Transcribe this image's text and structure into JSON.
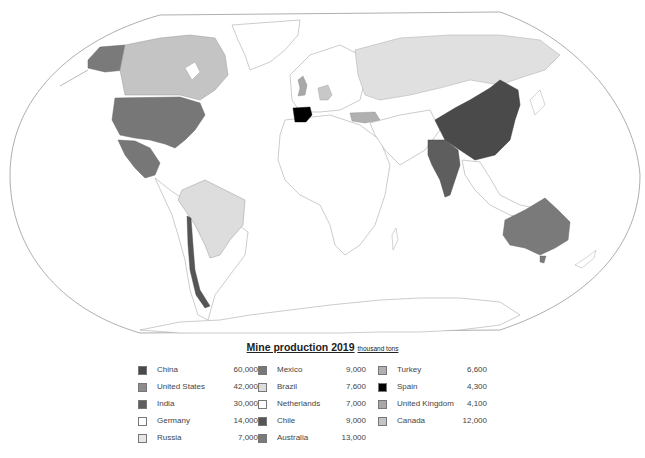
{
  "legend": {
    "title": "Mine production 2019",
    "unit": "thousand tons",
    "columns": [
      [
        {
          "name": "China",
          "value": "60,000",
          "color": "#4a4a4a"
        },
        {
          "name": "United States",
          "value": "42,000",
          "color": "#8c8c8c"
        },
        {
          "name": "India",
          "value": "30,000",
          "color": "#5e5e5e"
        },
        {
          "name": "Germany",
          "value": "14,000",
          "color": "#ffffff"
        },
        {
          "name": "Russia",
          "value": "7,000",
          "color": "#e6e6e6"
        }
      ],
      [
        {
          "name": "Mexico",
          "value": "9,000",
          "color": "#777777"
        },
        {
          "name": "Brazil",
          "value": "7,600",
          "color": "#dddddd"
        },
        {
          "name": "Netherlands",
          "value": "7,000",
          "color": "#ffffff"
        },
        {
          "name": "Chile",
          "value": "9,000",
          "color": "#555555"
        },
        {
          "name": "Australia",
          "value": "13,000",
          "color": "#7a7a7a"
        }
      ],
      [
        {
          "name": "Turkey",
          "value": "6,600",
          "color": "#b0b0b0"
        },
        {
          "name": "Spain",
          "value": "4,300",
          "color": "#000000"
        },
        {
          "name": "United Kingdom",
          "value": "4,100",
          "color": "#a8a8a8"
        },
        {
          "name": "Canada",
          "value": "12,000",
          "color": "#c4c4c4"
        }
      ]
    ]
  },
  "map": {
    "projection": "robinson-like",
    "regions": [
      {
        "country": "China",
        "color": "#4a4a4a"
      },
      {
        "country": "United States",
        "color": "#777777"
      },
      {
        "country": "Alaska",
        "color": "#7a7a7a"
      },
      {
        "country": "India",
        "color": "#5e5e5e"
      },
      {
        "country": "Russia",
        "color": "#e0e0e0"
      },
      {
        "country": "Canada",
        "color": "#c4c4c4"
      },
      {
        "country": "Mexico",
        "color": "#777777"
      },
      {
        "country": "Brazil",
        "color": "#dddddd"
      },
      {
        "country": "Chile",
        "color": "#555555"
      },
      {
        "country": "Australia",
        "color": "#7a7a7a"
      },
      {
        "country": "Turkey",
        "color": "#b0b0b0"
      },
      {
        "country": "Spain",
        "color": "#000000"
      },
      {
        "country": "United Kingdom",
        "color": "#a8a8a8"
      },
      {
        "country": "Germany",
        "color": "#c8c8c8"
      }
    ]
  }
}
